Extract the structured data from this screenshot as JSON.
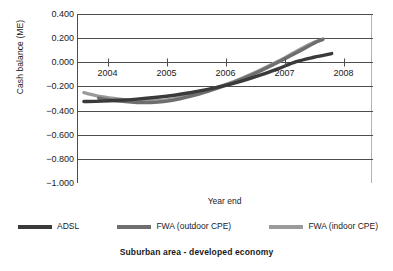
{
  "caption": "Suburban area - developed economy",
  "axes": {
    "y_title": "Cash balance (ME)",
    "x_title": "Year end",
    "y_ticks": [
      "0.400",
      "0.200",
      "0.000",
      "-0.200",
      "-0.400",
      "-0.600",
      "-0.800",
      "-1.000"
    ],
    "x_ticks": [
      "2004",
      "2005",
      "2006",
      "2007",
      "2008"
    ]
  },
  "legend": {
    "entries": [
      {
        "label": "ADSL",
        "color": "#3a3a3a"
      },
      {
        "label": "FWA (outdoor CPE)",
        "color": "#6e6e6e"
      },
      {
        "label": "FWA (indoor CPE)",
        "color": "#9a9a9a"
      }
    ]
  },
  "chart_data": {
    "type": "line",
    "title": "Suburban area - developed economy",
    "xlabel": "Year end",
    "ylabel": "Cash balance (ME)",
    "xlim": [
      2003.5,
      2008.5
    ],
    "ylim": [
      -1.0,
      0.4
    ],
    "yticks": [
      0.4,
      0.2,
      0.0,
      -0.2,
      -0.4,
      -0.6,
      -0.8,
      -1.0
    ],
    "xticks": [
      2004,
      2005,
      2006,
      2007,
      2008
    ],
    "grid": "horizontal",
    "legend_position": "below-axes",
    "series": [
      {
        "name": "ADSL",
        "color": "#3a3a3a",
        "x": [
          2003.6,
          2003.9,
          2004.2,
          2004.5,
          2004.8,
          2005.1,
          2005.4,
          2005.7,
          2006.0,
          2006.3,
          2006.6,
          2006.9,
          2007.2,
          2007.5,
          2007.8
        ],
        "y": [
          -0.325,
          -0.322,
          -0.315,
          -0.305,
          -0.292,
          -0.275,
          -0.252,
          -0.225,
          -0.192,
          -0.152,
          -0.105,
          -0.052,
          0.005,
          0.042,
          0.072
        ]
      },
      {
        "name": "FWA (outdoor CPE)",
        "color": "#6e6e6e",
        "x": [
          2003.85,
          2004.2,
          2004.5,
          2004.8,
          2005.1,
          2005.4,
          2005.7,
          2006.0,
          2006.3,
          2006.6,
          2006.9,
          2007.2,
          2007.5,
          2007.65
        ],
        "y": [
          -0.298,
          -0.322,
          -0.333,
          -0.332,
          -0.315,
          -0.282,
          -0.24,
          -0.192,
          -0.135,
          -0.07,
          0.002,
          0.078,
          0.158,
          0.19
        ]
      },
      {
        "name": "FWA (indoor CPE)",
        "color": "#9a9a9a",
        "x": [
          2003.6,
          2003.9,
          2004.2,
          2004.5,
          2004.8,
          2005.1,
          2005.4,
          2005.7,
          2006.0,
          2006.3,
          2006.6,
          2006.9,
          2007.2,
          2007.5,
          2007.65
        ],
        "y": [
          -0.252,
          -0.285,
          -0.305,
          -0.318,
          -0.32,
          -0.305,
          -0.272,
          -0.232,
          -0.185,
          -0.128,
          -0.062,
          0.01,
          0.09,
          0.165,
          0.19
        ]
      }
    ]
  }
}
